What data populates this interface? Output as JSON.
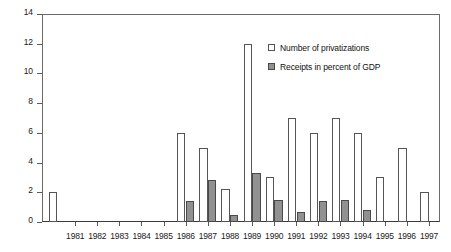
{
  "chart_data": {
    "type": "bar",
    "title": "",
    "xlabel": "",
    "ylabel": "",
    "ylim": [
      0,
      14
    ],
    "ytick_step": 2,
    "yticks": [
      0,
      2,
      4,
      6,
      8,
      10,
      12,
      14
    ],
    "ytick_labels": [
      "0",
      "2",
      "4",
      "6",
      "8",
      "10",
      "12",
      "14"
    ],
    "grid": false,
    "legend_position": "top-right",
    "categories": [
      "1981",
      "1982",
      "1983",
      "1984",
      "1985",
      "1986",
      "1987",
      "1988",
      "1989",
      "1990",
      "1991",
      "1992",
      "1993",
      "1994",
      "1995",
      "1996",
      "1997"
    ],
    "series": [
      {
        "name": "Number of privatizations",
        "color": "#ffffff",
        "edge_color": "#555555",
        "values": [
          0,
          0,
          0,
          0,
          0,
          6,
          5,
          2.2,
          12,
          3,
          7,
          6,
          7,
          6,
          3,
          5,
          2
        ]
      },
      {
        "name": "Receipts in percent of GDP",
        "color": "#919191",
        "edge_color": "#4a4a4a",
        "values": [
          0,
          0,
          0,
          0,
          0,
          1.4,
          2.8,
          0.5,
          3.3,
          1.5,
          0.7,
          1.4,
          1.5,
          0.8,
          0,
          0,
          0
        ]
      }
    ],
    "leading_bar": {
      "name": "Number of privatizations",
      "value": 2,
      "note": "leftmost bar before 1981 tick"
    }
  },
  "legend": {
    "entries": [
      {
        "label": "Number of privatizations",
        "swatch": "white-square-icon"
      },
      {
        "label": "Receipts in percent of GDP",
        "swatch": "gray-square-icon"
      }
    ]
  }
}
